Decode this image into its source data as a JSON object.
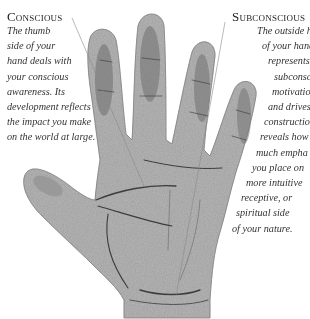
{
  "illustration": {
    "subject": "palm-of-hand-illustration",
    "colors": {
      "background": "#ffffff",
      "skin_base": "#b9b9b9",
      "skin_shadow": "#6e6e6e",
      "palm_lines": "#3c3c3c",
      "leader_line": "#8a8a8a",
      "text": "#2a2a2a"
    }
  },
  "conscious": {
    "heading": "Conscious",
    "lines": [
      "The thumb",
      "side of your",
      "hand deals with",
      "your conscious",
      "awareness. Its",
      "development reflects",
      "the impact you make",
      "on the world at large."
    ]
  },
  "subconscious": {
    "heading": "Subconscious",
    "lines": [
      "The outside hal",
      "of your hand",
      "represents y",
      "subconsc",
      "motivatio",
      "and drives",
      "constructio",
      "reveals how",
      "much empha",
      "you place on",
      "more intuitive",
      "receptive, or",
      "spiritual side",
      "of your nature."
    ]
  }
}
